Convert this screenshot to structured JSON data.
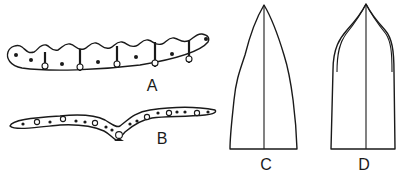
{
  "figure": {
    "panels": [
      {
        "id": "A",
        "label": "A",
        "description": "Elongated curved section with scalloped upper edge, small dots and ringed nodes connected by vertical bars"
      },
      {
        "id": "B",
        "label": "B",
        "description": "Thin wavy section bending down at center, with row of dots and ringed nodes"
      },
      {
        "id": "C",
        "label": "C",
        "description": "Pointed arch outline with central vertical midline"
      },
      {
        "id": "D",
        "label": "D",
        "description": "Rounded pointed arch outline with double curved upper edges and central vertical midline"
      }
    ],
    "colors": {
      "ink": "#1a1a1a",
      "background": "#ffffff"
    }
  }
}
